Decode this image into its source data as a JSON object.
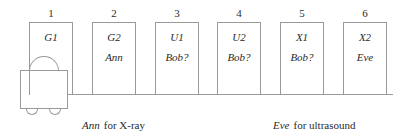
{
  "diagram": {
    "type": "train-schedule-diagram",
    "positions": [
      {
        "number": "1",
        "code": "G1",
        "person": ""
      },
      {
        "number": "2",
        "code": "G2",
        "person": "Ann"
      },
      {
        "number": "3",
        "code": "U1",
        "person": "Bob?"
      },
      {
        "number": "4",
        "code": "U2",
        "person": "Bob?"
      },
      {
        "number": "5",
        "code": "X1",
        "person": "Bob?"
      },
      {
        "number": "6",
        "code": "X2",
        "person": "Eve"
      }
    ],
    "locomotive": {
      "label": "locomotive"
    },
    "captions": [
      {
        "subject": "Ann",
        "text": "for X-ray"
      },
      {
        "subject": "Eve",
        "text": "for ultrasound"
      }
    ],
    "colors": {
      "line": "#9a9a9a",
      "text": "#2b2b2b",
      "background": "#ffffff"
    }
  }
}
